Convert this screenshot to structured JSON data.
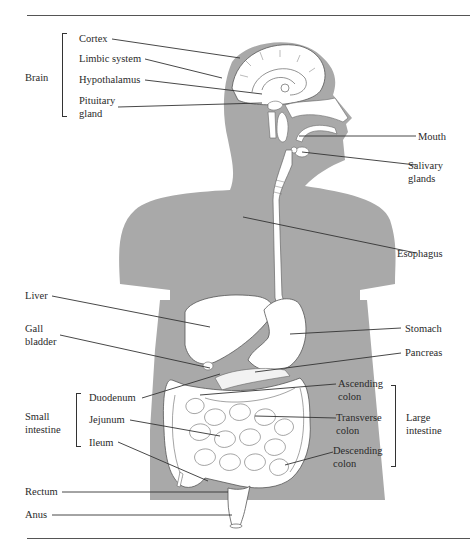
{
  "caption_top": "· · ·",
  "colors": {
    "body_fill": "#a9a9a9",
    "organ_fill": "#ffffff",
    "line": "#333333",
    "rule": "#555555"
  },
  "groups": {
    "brain": "Brain",
    "small_intestine": "Small\nintestine",
    "large_intestine": "Large\nintestine"
  },
  "labels": {
    "cortex": "Cortex",
    "limbic_system": "Limbic system",
    "hypothalamus": "Hypothalamus",
    "pituitary_gland": "Pituitary\ngland",
    "mouth": "Mouth",
    "salivary_glands": "Salivary\nglands",
    "esophagus": "Esophagus",
    "liver": "Liver",
    "gall_bladder": "Gall\nbladder",
    "stomach": "Stomach",
    "pancreas": "Pancreas",
    "duodenum": "Duodenum",
    "jejunum": "Jejunum",
    "ileum": "Ileum",
    "ascending_colon": "Ascending\ncolon",
    "transverse_colon": "Transverse\ncolon",
    "descending_colon": "Descending\ncolon",
    "rectum": "Rectum",
    "anus": "Anus"
  }
}
